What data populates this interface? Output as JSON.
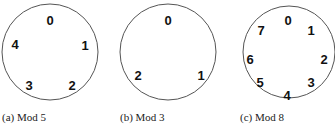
{
  "figures": [
    {
      "id": "a",
      "caption": "(a) Mod 5",
      "circle": {
        "cx": 50,
        "cy": 52,
        "r": 48
      },
      "labels": [
        {
          "text": "0",
          "x": 50,
          "y": 22
        },
        {
          "text": "1",
          "x": 85,
          "y": 47
        },
        {
          "text": "2",
          "x": 72,
          "y": 87
        },
        {
          "text": "3",
          "x": 29,
          "y": 87
        },
        {
          "text": "4",
          "x": 15,
          "y": 46
        }
      ],
      "caption_pos": {
        "x": 2,
        "y": 121
      }
    },
    {
      "id": "b",
      "caption": "(b) Mod 3",
      "circle": {
        "cx": 168,
        "cy": 52,
        "r": 48
      },
      "labels": [
        {
          "text": "0",
          "x": 168,
          "y": 22
        },
        {
          "text": "1",
          "x": 201,
          "y": 77
        },
        {
          "text": "2",
          "x": 138,
          "y": 77
        }
      ],
      "caption_pos": {
        "x": 120,
        "y": 121
      }
    },
    {
      "id": "c",
      "caption": "(c) Mod 8",
      "circle": {
        "cx": 289,
        "cy": 52,
        "r": 46
      },
      "labels": [
        {
          "text": "0",
          "x": 288,
          "y": 22
        },
        {
          "text": "1",
          "x": 311,
          "y": 32
        },
        {
          "text": "2",
          "x": 324,
          "y": 61
        },
        {
          "text": "3",
          "x": 311,
          "y": 84
        },
        {
          "text": "4",
          "x": 287,
          "y": 97
        },
        {
          "text": "5",
          "x": 260,
          "y": 84
        },
        {
          "text": "6",
          "x": 250,
          "y": 61
        },
        {
          "text": "7",
          "x": 261,
          "y": 32
        }
      ],
      "caption_pos": {
        "x": 240,
        "y": 121
      }
    }
  ]
}
